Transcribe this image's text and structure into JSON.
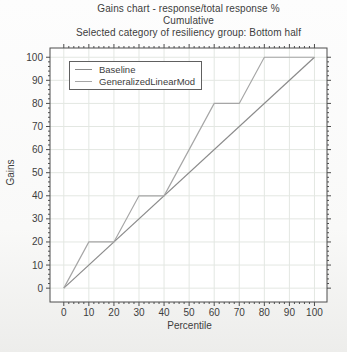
{
  "chart_data": {
    "type": "line",
    "title": "Gains chart - response/total response %",
    "subtitle": "Cumulative",
    "selection_note": "Selected category of resiliency group: Bottom half",
    "xlabel": "Percentile",
    "ylabel": "Gains",
    "xticks": [
      0,
      10,
      20,
      30,
      40,
      50,
      60,
      70,
      80,
      90,
      100
    ],
    "yticks": [
      0,
      10,
      20,
      30,
      40,
      50,
      60,
      70,
      80,
      90,
      100
    ],
    "xlim": [
      -5.5,
      105
    ],
    "ylim": [
      -6,
      104
    ],
    "grid": true,
    "legend_position": "top-left",
    "series": [
      {
        "name": "Baseline",
        "color": "#8a8a8a",
        "points": [
          [
            0,
            0
          ],
          [
            100,
            100
          ]
        ]
      },
      {
        "name": "GeneralizedLinearMod",
        "color": "#a6a6a6",
        "points": [
          [
            0,
            0
          ],
          [
            10,
            20
          ],
          [
            20,
            20
          ],
          [
            30,
            40
          ],
          [
            40,
            40
          ],
          [
            50,
            60
          ],
          [
            60,
            80
          ],
          [
            70,
            80
          ],
          [
            80,
            100
          ],
          [
            90,
            100
          ],
          [
            100,
            100
          ]
        ]
      }
    ]
  },
  "colors": {
    "frame": "#4d4d4d",
    "grid": "#e3e7e2",
    "text": "#3d3d3d",
    "legend_border": "#606060",
    "plot_bg": "#ffffff"
  }
}
